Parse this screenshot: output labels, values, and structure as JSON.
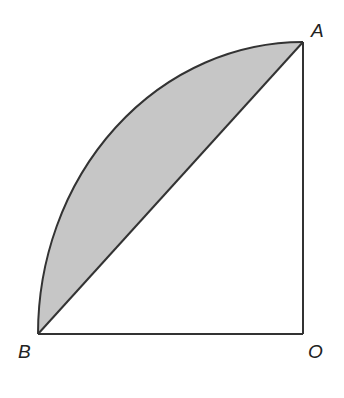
{
  "figure": {
    "type": "quarter-circle-segment",
    "points": {
      "A": {
        "label": "A",
        "x": 303,
        "y": 42
      },
      "B": {
        "label": "B",
        "x": 38,
        "y": 334
      },
      "O": {
        "label": "O",
        "x": 303,
        "y": 334
      }
    },
    "colors": {
      "stroke": "#333333",
      "shade": "#c6c6c6",
      "background": "#ffffff"
    }
  }
}
